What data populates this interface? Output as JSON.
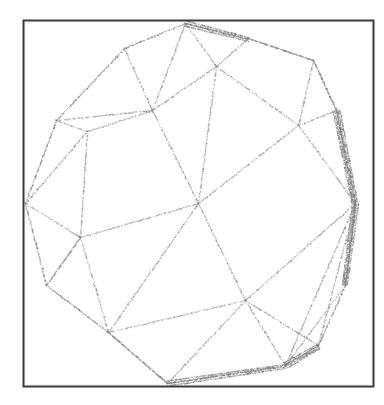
{
  "figure": {
    "kind": "line-drawing",
    "caption": "",
    "background_color": "#ffffff",
    "canvas": {
      "width": 384,
      "height": 405
    }
  },
  "frame": {
    "name": "figure-border",
    "x": 23,
    "y": 20,
    "width": 350,
    "height": 366,
    "stroke_color": "#3b3b3b",
    "stroke_width": 2.0,
    "fill_color": "#ffffff"
  },
  "wireframe": {
    "stroke_color": "#8a8a8a",
    "silhouette_color": "#6f6f6f",
    "stroke_width": 0.85,
    "dither": true,
    "vertices": [
      {
        "id": 0,
        "name": "top-apex",
        "x": 185,
        "y": 23
      },
      {
        "id": 1,
        "name": "top-left-upper",
        "x": 124,
        "y": 48
      },
      {
        "id": 2,
        "name": "top-right-upper",
        "x": 248,
        "y": 38
      },
      {
        "id": 3,
        "name": "upper-left-hub",
        "x": 152,
        "y": 110
      },
      {
        "id": 4,
        "name": "upper-mid-hub",
        "x": 216,
        "y": 66
      },
      {
        "id": 5,
        "name": "upper-right-hub",
        "x": 313,
        "y": 60
      },
      {
        "id": 6,
        "name": "right-upper-hub",
        "x": 298,
        "y": 125
      },
      {
        "id": 7,
        "name": "left-rim-upper",
        "x": 56,
        "y": 120
      },
      {
        "id": 8,
        "name": "inner-left-upper",
        "x": 87,
        "y": 131
      },
      {
        "id": 9,
        "name": "left-apex",
        "x": 25,
        "y": 203
      },
      {
        "id": 10,
        "name": "center-hub",
        "x": 198,
        "y": 203
      },
      {
        "id": 11,
        "name": "inner-left-mid",
        "x": 80,
        "y": 237
      },
      {
        "id": 12,
        "name": "right-apex",
        "x": 355,
        "y": 203
      },
      {
        "id": 13,
        "name": "left-rim-lower",
        "x": 46,
        "y": 285
      },
      {
        "id": 14,
        "name": "lower-left-hub",
        "x": 108,
        "y": 332
      },
      {
        "id": 15,
        "name": "lower-mid-hub",
        "x": 245,
        "y": 300
      },
      {
        "id": 16,
        "name": "bottom-apex",
        "x": 167,
        "y": 383
      },
      {
        "id": 17,
        "name": "bottom-right-hub",
        "x": 285,
        "y": 365
      },
      {
        "id": 18,
        "name": "right-lower-rim",
        "x": 345,
        "y": 285
      },
      {
        "id": 19,
        "name": "right-upper-rim",
        "x": 336,
        "y": 110
      },
      {
        "id": 20,
        "name": "bottom-right-edge",
        "x": 318,
        "y": 345
      }
    ],
    "edges": [
      {
        "from": 0,
        "to": 1,
        "kind": "silhouette"
      },
      {
        "from": 0,
        "to": 2,
        "kind": "silhouette"
      },
      {
        "from": 1,
        "to": 7,
        "kind": "silhouette"
      },
      {
        "from": 7,
        "to": 9,
        "kind": "silhouette"
      },
      {
        "from": 9,
        "to": 13,
        "kind": "silhouette"
      },
      {
        "from": 13,
        "to": 14,
        "kind": "silhouette"
      },
      {
        "from": 14,
        "to": 16,
        "kind": "silhouette"
      },
      {
        "from": 16,
        "to": 17,
        "kind": "silhouette"
      },
      {
        "from": 17,
        "to": 20,
        "kind": "silhouette"
      },
      {
        "from": 20,
        "to": 18,
        "kind": "silhouette"
      },
      {
        "from": 18,
        "to": 12,
        "kind": "silhouette"
      },
      {
        "from": 12,
        "to": 19,
        "kind": "silhouette"
      },
      {
        "from": 19,
        "to": 5,
        "kind": "silhouette"
      },
      {
        "from": 5,
        "to": 2,
        "kind": "silhouette"
      },
      {
        "from": 0,
        "to": 3,
        "kind": "face"
      },
      {
        "from": 0,
        "to": 4,
        "kind": "face"
      },
      {
        "from": 1,
        "to": 3,
        "kind": "face"
      },
      {
        "from": 2,
        "to": 4,
        "kind": "face"
      },
      {
        "from": 2,
        "to": 5,
        "kind": "face"
      },
      {
        "from": 3,
        "to": 4,
        "kind": "face"
      },
      {
        "from": 3,
        "to": 8,
        "kind": "face"
      },
      {
        "from": 3,
        "to": 10,
        "kind": "face"
      },
      {
        "from": 4,
        "to": 6,
        "kind": "face"
      },
      {
        "from": 4,
        "to": 10,
        "kind": "face"
      },
      {
        "from": 5,
        "to": 6,
        "kind": "face"
      },
      {
        "from": 5,
        "to": 19,
        "kind": "face"
      },
      {
        "from": 6,
        "to": 10,
        "kind": "face"
      },
      {
        "from": 6,
        "to": 12,
        "kind": "face"
      },
      {
        "from": 6,
        "to": 19,
        "kind": "face"
      },
      {
        "from": 7,
        "to": 8,
        "kind": "face"
      },
      {
        "from": 7,
        "to": 3,
        "kind": "face"
      },
      {
        "from": 8,
        "to": 9,
        "kind": "face"
      },
      {
        "from": 8,
        "to": 11,
        "kind": "face"
      },
      {
        "from": 9,
        "to": 11,
        "kind": "face"
      },
      {
        "from": 10,
        "to": 11,
        "kind": "face"
      },
      {
        "from": 10,
        "to": 14,
        "kind": "face"
      },
      {
        "from": 10,
        "to": 15,
        "kind": "face"
      },
      {
        "from": 11,
        "to": 13,
        "kind": "face"
      },
      {
        "from": 11,
        "to": 14,
        "kind": "face"
      },
      {
        "from": 12,
        "to": 15,
        "kind": "face"
      },
      {
        "from": 12,
        "to": 18,
        "kind": "face"
      },
      {
        "from": 13,
        "to": 11,
        "kind": "face"
      },
      {
        "from": 14,
        "to": 15,
        "kind": "face"
      },
      {
        "from": 14,
        "to": 16,
        "kind": "face"
      },
      {
        "from": 15,
        "to": 16,
        "kind": "face"
      },
      {
        "from": 15,
        "to": 17,
        "kind": "face"
      },
      {
        "from": 15,
        "to": 20,
        "kind": "face"
      },
      {
        "from": 17,
        "to": 18,
        "kind": "face"
      },
      {
        "from": 17,
        "to": 12,
        "kind": "face"
      },
      {
        "from": 20,
        "to": 12,
        "kind": "face"
      }
    ],
    "silhouette_bundles": [
      {
        "name": "right-edge-bundle",
        "from": 19,
        "to": 12,
        "count": 5,
        "spread": 3.5
      },
      {
        "name": "right-lower-bundle",
        "from": 12,
        "to": 18,
        "count": 4,
        "spread": 3.0
      },
      {
        "name": "bottom-right-bundle",
        "from": 17,
        "to": 20,
        "count": 4,
        "spread": 3.0
      },
      {
        "name": "top-apex-bundle",
        "from": 0,
        "to": 2,
        "count": 3,
        "spread": 2.5
      },
      {
        "name": "bottom-apex-bundle",
        "from": 16,
        "to": 17,
        "count": 3,
        "spread": 2.5
      }
    ]
  }
}
